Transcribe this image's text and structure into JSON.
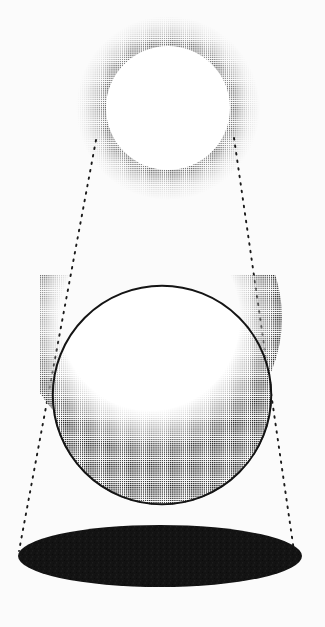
{
  "figure": {
    "background_color": "#fbfbfb",
    "ink_color": "#111111",
    "width": 325,
    "height": 627
  },
  "chart_data": {
    "type": "diagram",
    "subtitle": "",
    "xlabel": "",
    "ylabel": "",
    "grid": false,
    "legend_position": "none",
    "annotations": [],
    "elements": [
      {
        "name": "light-source",
        "shape": "circle",
        "role": "glowing light source rendered as a halftone ring",
        "cx": 168,
        "cy": 108,
        "r": 66,
        "fill": "#ffffff",
        "halo": {
          "inner_r": 62,
          "outer_r": 90,
          "peak_r": 70,
          "color": "#6f6f6f",
          "texture": "halftone-dots"
        }
      },
      {
        "name": "sphere",
        "shape": "circle",
        "role": "opaque sphere lit from above, dark crescent terminator at the bottom",
        "cx": 162,
        "cy": 395,
        "r": 110,
        "fill": "#ffffff",
        "outline_color": "#141414",
        "outline_width": 2,
        "shading": {
          "type": "crescent",
          "color": "#101010",
          "light_center_x": 150,
          "light_center_y": 318,
          "light_radius": 130,
          "texture": "halftone-dots"
        }
      },
      {
        "name": "cast-shadow",
        "shape": "ellipse",
        "role": "solid black ellipse shadow on the ground plane",
        "cx": 160,
        "cy": 556,
        "rx": 142,
        "ry": 31,
        "fill": "#131313",
        "texture": "grain"
      },
      {
        "name": "light-ray-left",
        "shape": "dotted-line",
        "role": "dotted tangent ray from the light source to the left edge of the shadow",
        "x1": 96,
        "y1": 140,
        "x2": 19,
        "y2": 551,
        "color": "#1a1a1a",
        "dash": "1.6 6"
      },
      {
        "name": "light-ray-right",
        "shape": "dotted-line",
        "role": "dotted tangent ray from the light source to the right edge of the shadow",
        "x1": 234,
        "y1": 138,
        "x2": 294,
        "y2": 551,
        "color": "#1a1a1a",
        "dash": "1.6 6"
      }
    ]
  },
  "labels": {
    "light_source": "",
    "sphere": "",
    "shadow": ""
  }
}
